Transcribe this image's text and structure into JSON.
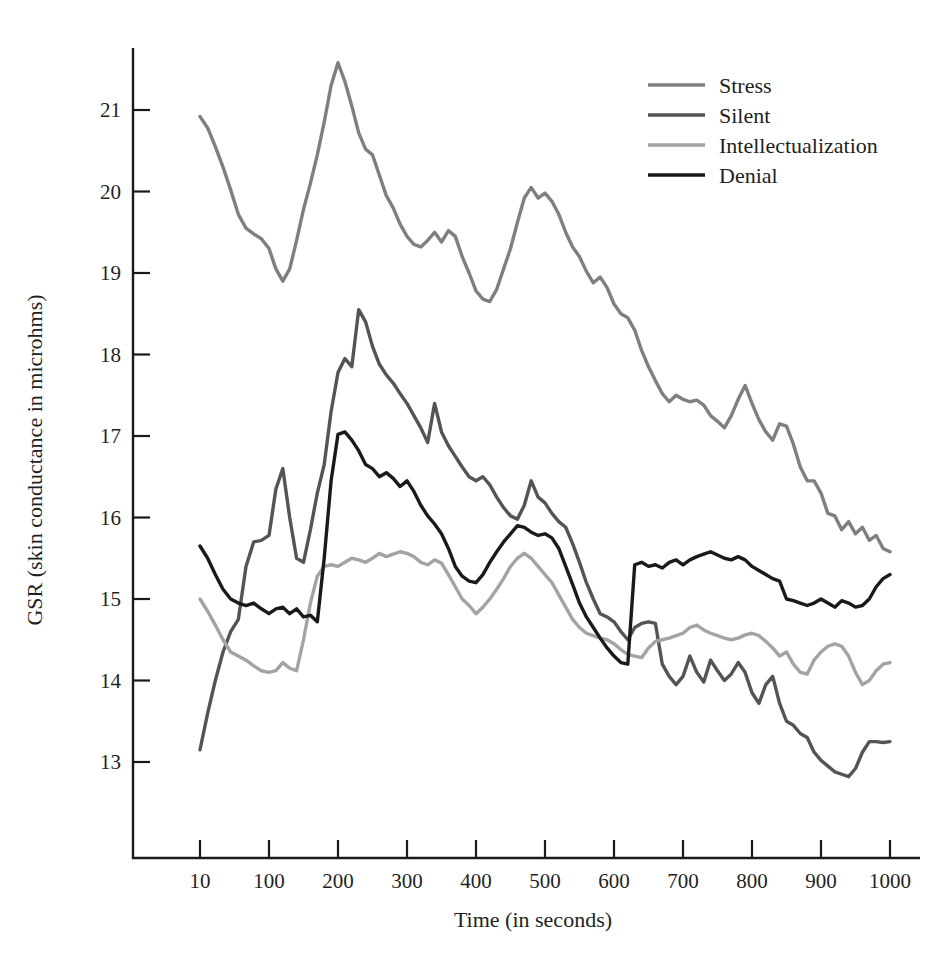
{
  "chart_data": {
    "type": "line",
    "title": "",
    "xlabel": "Time (in seconds)",
    "ylabel": "GSR (skin conductance in microhms)",
    "xlim": [
      10,
      1000
    ],
    "ylim": [
      12.4,
      21.85
    ],
    "grid": false,
    "legend_position": "top-right",
    "xticks": [
      10,
      100,
      200,
      300,
      400,
      500,
      600,
      700,
      800,
      900,
      1000
    ],
    "xtick_labels": [
      "10",
      "100",
      "200",
      "300",
      "400",
      "500",
      "600",
      "700",
      "800",
      "900",
      "1000"
    ],
    "yticks": [
      13,
      14,
      15,
      16,
      17,
      18,
      19,
      20,
      21
    ],
    "ytick_labels": [
      "13",
      "14",
      "15",
      "16",
      "17",
      "18",
      "19",
      "20",
      "21"
    ],
    "x": [
      10,
      20,
      30,
      40,
      50,
      60,
      70,
      80,
      90,
      100,
      110,
      120,
      130,
      140,
      150,
      160,
      170,
      180,
      190,
      200,
      210,
      220,
      230,
      240,
      250,
      260,
      270,
      280,
      290,
      300,
      310,
      320,
      330,
      340,
      350,
      360,
      370,
      380,
      390,
      400,
      410,
      420,
      430,
      440,
      450,
      460,
      470,
      480,
      490,
      500,
      510,
      520,
      530,
      540,
      550,
      560,
      570,
      580,
      590,
      600,
      610,
      620,
      630,
      640,
      650,
      660,
      670,
      680,
      690,
      700,
      710,
      720,
      730,
      740,
      750,
      760,
      770,
      780,
      790,
      800,
      810,
      820,
      830,
      840,
      850,
      860,
      870,
      880,
      890,
      900,
      910,
      920,
      930,
      940,
      950,
      960,
      970,
      980,
      990,
      1000
    ],
    "series": [
      {
        "name": "Stress",
        "color": "#7f7f7f",
        "linewidth": 3.4,
        "values": [
          20.92,
          20.78,
          20.55,
          20.3,
          20.02,
          19.72,
          19.55,
          19.48,
          19.42,
          19.3,
          19.05,
          18.9,
          19.05,
          19.4,
          19.78,
          20.1,
          20.45,
          20.85,
          21.3,
          21.58,
          21.35,
          21.05,
          20.72,
          20.52,
          20.45,
          20.2,
          19.95,
          19.8,
          19.6,
          19.45,
          19.35,
          19.32,
          19.4,
          19.5,
          19.38,
          19.52,
          19.45,
          19.2,
          19.0,
          18.78,
          18.68,
          18.65,
          18.8,
          19.05,
          19.3,
          19.62,
          19.92,
          20.05,
          19.92,
          19.98,
          19.88,
          19.72,
          19.5,
          19.32,
          19.2,
          19.02,
          18.88,
          18.95,
          18.82,
          18.62,
          18.5,
          18.45,
          18.3,
          18.05,
          17.85,
          17.68,
          17.52,
          17.42,
          17.5,
          17.45,
          17.42,
          17.44,
          17.38,
          17.25,
          17.18,
          17.1,
          17.25,
          17.45,
          17.62,
          17.4,
          17.2,
          17.05,
          16.95,
          17.15,
          17.12,
          16.9,
          16.62,
          16.45,
          16.45,
          16.3,
          16.05,
          16.02,
          15.85,
          15.95,
          15.8,
          15.88,
          15.72,
          15.78,
          15.62,
          15.58
        ]
      },
      {
        "name": "Silent",
        "color": "#545454",
        "linewidth": 3.4,
        "values": [
          13.15,
          13.6,
          14.0,
          14.35,
          14.6,
          14.75,
          15.4,
          15.7,
          15.72,
          15.78,
          16.35,
          16.6,
          16.0,
          15.5,
          15.45,
          15.85,
          16.3,
          16.65,
          17.3,
          17.78,
          17.95,
          17.85,
          18.55,
          18.4,
          18.1,
          17.88,
          17.75,
          17.65,
          17.52,
          17.4,
          17.25,
          17.1,
          16.92,
          17.4,
          17.05,
          16.88,
          16.75,
          16.62,
          16.5,
          16.45,
          16.5,
          16.4,
          16.25,
          16.12,
          16.02,
          15.98,
          16.15,
          16.45,
          16.25,
          16.18,
          16.05,
          15.95,
          15.88,
          15.68,
          15.45,
          15.2,
          15.0,
          14.82,
          14.78,
          14.72,
          14.6,
          14.5,
          14.65,
          14.7,
          14.72,
          14.7,
          14.2,
          14.05,
          13.95,
          14.05,
          14.3,
          14.1,
          13.98,
          14.25,
          14.12,
          14.0,
          14.08,
          14.22,
          14.1,
          13.85,
          13.72,
          13.95,
          14.05,
          13.72,
          13.5,
          13.45,
          13.35,
          13.3,
          13.12,
          13.02,
          12.95,
          12.88,
          12.85,
          12.82,
          12.92,
          13.12,
          13.25,
          13.25,
          13.24,
          13.25
        ]
      },
      {
        "name": "Intellectualization",
        "color": "#a3a3a3",
        "linewidth": 3.4,
        "values": [
          15.0,
          14.85,
          14.68,
          14.5,
          14.35,
          14.3,
          14.25,
          14.18,
          14.12,
          14.1,
          14.12,
          14.22,
          14.15,
          14.12,
          14.5,
          14.95,
          15.28,
          15.4,
          15.42,
          15.4,
          15.45,
          15.5,
          15.48,
          15.45,
          15.5,
          15.56,
          15.52,
          15.55,
          15.58,
          15.56,
          15.52,
          15.45,
          15.42,
          15.48,
          15.44,
          15.3,
          15.15,
          15.0,
          14.92,
          14.82,
          14.9,
          15.0,
          15.12,
          15.25,
          15.4,
          15.5,
          15.56,
          15.5,
          15.4,
          15.3,
          15.2,
          15.05,
          14.9,
          14.75,
          14.65,
          14.58,
          14.55,
          14.52,
          14.5,
          14.45,
          14.38,
          14.32,
          14.3,
          14.28,
          14.4,
          14.48,
          14.5,
          14.52,
          14.55,
          14.58,
          14.65,
          14.68,
          14.62,
          14.58,
          14.55,
          14.52,
          14.5,
          14.52,
          14.56,
          14.58,
          14.55,
          14.48,
          14.4,
          14.3,
          14.35,
          14.2,
          14.1,
          14.08,
          14.25,
          14.35,
          14.42,
          14.45,
          14.42,
          14.3,
          14.1,
          13.95,
          14.0,
          14.12,
          14.2,
          14.22
        ]
      },
      {
        "name": "Denial",
        "color": "#1a1a1a",
        "linewidth": 3.4,
        "values": [
          15.65,
          15.5,
          15.3,
          15.12,
          15.0,
          14.95,
          14.92,
          14.95,
          14.88,
          14.82,
          14.88,
          14.9,
          14.82,
          14.88,
          14.78,
          14.8,
          14.72,
          15.5,
          16.45,
          17.02,
          17.05,
          16.95,
          16.82,
          16.65,
          16.6,
          16.5,
          16.55,
          16.48,
          16.38,
          16.45,
          16.32,
          16.15,
          16.02,
          15.92,
          15.8,
          15.62,
          15.4,
          15.28,
          15.22,
          15.2,
          15.3,
          15.45,
          15.58,
          15.7,
          15.8,
          15.9,
          15.88,
          15.82,
          15.78,
          15.8,
          15.75,
          15.62,
          15.4,
          15.18,
          14.95,
          14.78,
          14.65,
          14.52,
          14.4,
          14.3,
          14.22,
          14.2,
          15.42,
          15.45,
          15.4,
          15.42,
          15.38,
          15.45,
          15.48,
          15.42,
          15.48,
          15.52,
          15.55,
          15.58,
          15.54,
          15.5,
          15.48,
          15.52,
          15.48,
          15.4,
          15.35,
          15.3,
          15.25,
          15.22,
          15.0,
          14.98,
          14.95,
          14.92,
          14.95,
          15.0,
          14.95,
          14.9,
          14.98,
          14.95,
          14.9,
          14.92,
          15.0,
          15.15,
          15.25,
          15.3
        ]
      }
    ]
  },
  "legend": {
    "items": [
      {
        "label": "Stress"
      },
      {
        "label": "Silent"
      },
      {
        "label": "Intellectualization"
      },
      {
        "label": "Denial"
      }
    ]
  },
  "axes": {
    "x_title": "Time (in seconds)",
    "y_title": "GSR (skin conductance in microhms)"
  }
}
